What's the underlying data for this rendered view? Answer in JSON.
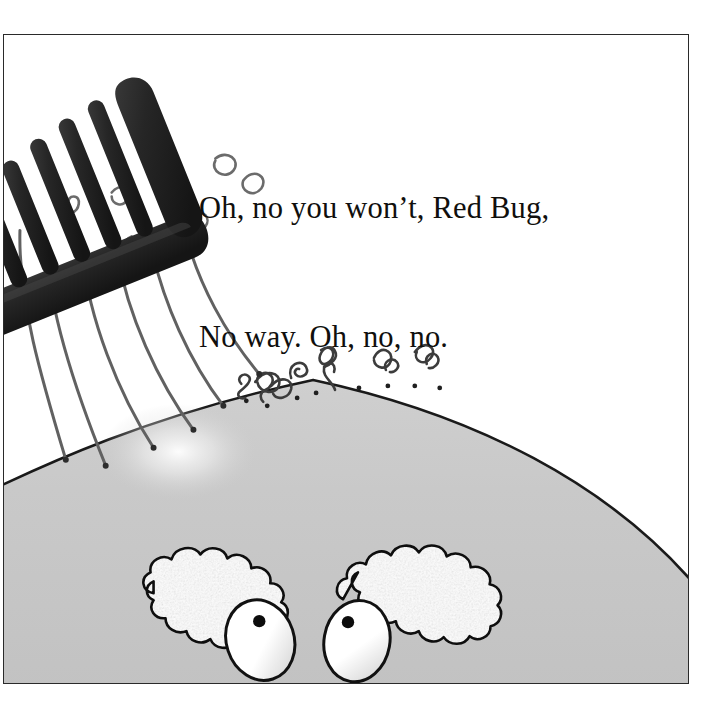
{
  "page": {
    "type": "picture-book-illustration",
    "background_color": "#ffffff",
    "width": 715,
    "height": 721
  },
  "frame": {
    "border_color": "#2a2a2a",
    "fill_color": "#ffffff",
    "x": 3,
    "y": 34,
    "width": 686,
    "height": 650
  },
  "caption": {
    "line1": "Oh, no you won’t, Red Bug,",
    "line2": "No way. Oh, no, no.",
    "color": "#100f0d",
    "font_size_px": 30
  },
  "artwork": {
    "title": "Bug with comb above a gray head",
    "head": {
      "name": "character-head",
      "fill_color": "#c8c8c8",
      "outline_color": "#1a1a1a",
      "highlight_color": "#f7f7f7",
      "apex_x": 312,
      "apex_y": 378
    },
    "comb": {
      "name": "comb",
      "color": "#232323",
      "teeth_count": 9,
      "angle_deg": -22
    },
    "hair_strands": {
      "name": "hair-strands",
      "color": "#5a5a5a",
      "long_count": 6,
      "squiggle_count": 8
    },
    "eyebrows": {
      "name": "eyebrows",
      "fill_color": "#fdfdfd",
      "outline_color": "#111111",
      "count": 2
    },
    "eyes": {
      "name": "eyes",
      "fill_color": "#ffffff",
      "outline_color": "#111111",
      "pupil_color": "#0c0c0c",
      "count": 2
    }
  }
}
